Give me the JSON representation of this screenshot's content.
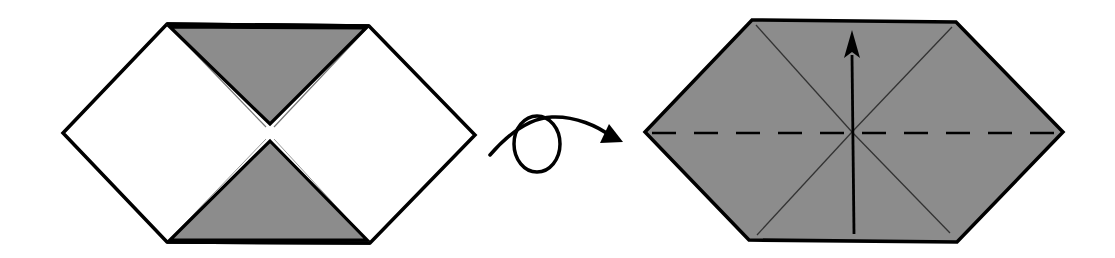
{
  "diagram": {
    "type": "origami-fold-diagram",
    "steps": [
      {
        "id": "step-before",
        "description": "Hexagon with top and bottom triangles folded to center (colored side showing)",
        "outline": [
          [
            63,
            133
          ],
          [
            167,
            24
          ],
          [
            369,
            26
          ],
          [
            475,
            135
          ],
          [
            370,
            243
          ],
          [
            167,
            242
          ]
        ],
        "white_fill": "#ffffff",
        "colored_fill": "#8c8c8c",
        "flaps": [
          {
            "name": "top-flap",
            "points": [
              [
                167,
                24
              ],
              [
                369,
                26
              ],
              [
                270,
                125
              ]
            ]
          },
          {
            "name": "bottom-flap",
            "points": [
              [
                270,
                140
              ],
              [
                370,
                243
              ],
              [
                167,
                242
              ]
            ]
          }
        ]
      },
      {
        "id": "turn-over-symbol",
        "description": "Turn over (loop arrow)",
        "meaning": "Turn the model over"
      },
      {
        "id": "step-after",
        "description": "Model turned over: fully colored hexagon with diagonal creases, horizontal valley fold line, and arrow indicating fold bottom half up",
        "outline": [
          [
            645,
            132
          ],
          [
            752,
            20
          ],
          [
            956,
            22
          ],
          [
            1063,
            132
          ],
          [
            957,
            242
          ],
          [
            749,
            240
          ]
        ],
        "fill": "#8c8c8c",
        "center": [
          852,
          132
        ],
        "creases": [
          [
            [
              756,
              25
            ],
            [
              852,
              132
            ]
          ],
          [
            [
              952,
              27
            ],
            [
              852,
              132
            ]
          ],
          [
            [
              757,
              235
            ],
            [
              852,
              132
            ]
          ],
          [
            [
              950,
              233
            ],
            [
              852,
              132
            ]
          ]
        ],
        "valley_fold": {
          "from": [
            652,
            133
          ],
          "to": [
            1056,
            133
          ],
          "style": "dashed"
        },
        "fold_arrow": {
          "from": [
            854,
            234
          ],
          "to": [
            852,
            30
          ],
          "direction": "up"
        }
      }
    ],
    "colors": {
      "stroke": "#000000",
      "paper_colored": "#8c8c8c",
      "paper_white": "#ffffff",
      "crease": "#333333"
    }
  }
}
